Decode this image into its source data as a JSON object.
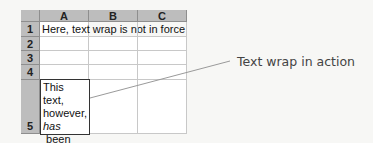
{
  "spreadsheet": {
    "columns": [
      "A",
      "B",
      "C"
    ],
    "rows": [
      "1",
      "2",
      "3",
      "4",
      "5"
    ],
    "cells": {
      "A1": "Here, text wrap is not in force",
      "A5": {
        "line1": "This text,",
        "line2": "however,",
        "line3_italic": "has",
        "line3_rest": " been",
        "line4": "wrapped"
      }
    }
  },
  "annotation": {
    "label": "Text wrap in action"
  },
  "colors": {
    "header_bg": "#bdbdbd",
    "gridline": "#c8c8c8",
    "background": "#f7f7f5",
    "leader_line": "#9a9a9a"
  }
}
